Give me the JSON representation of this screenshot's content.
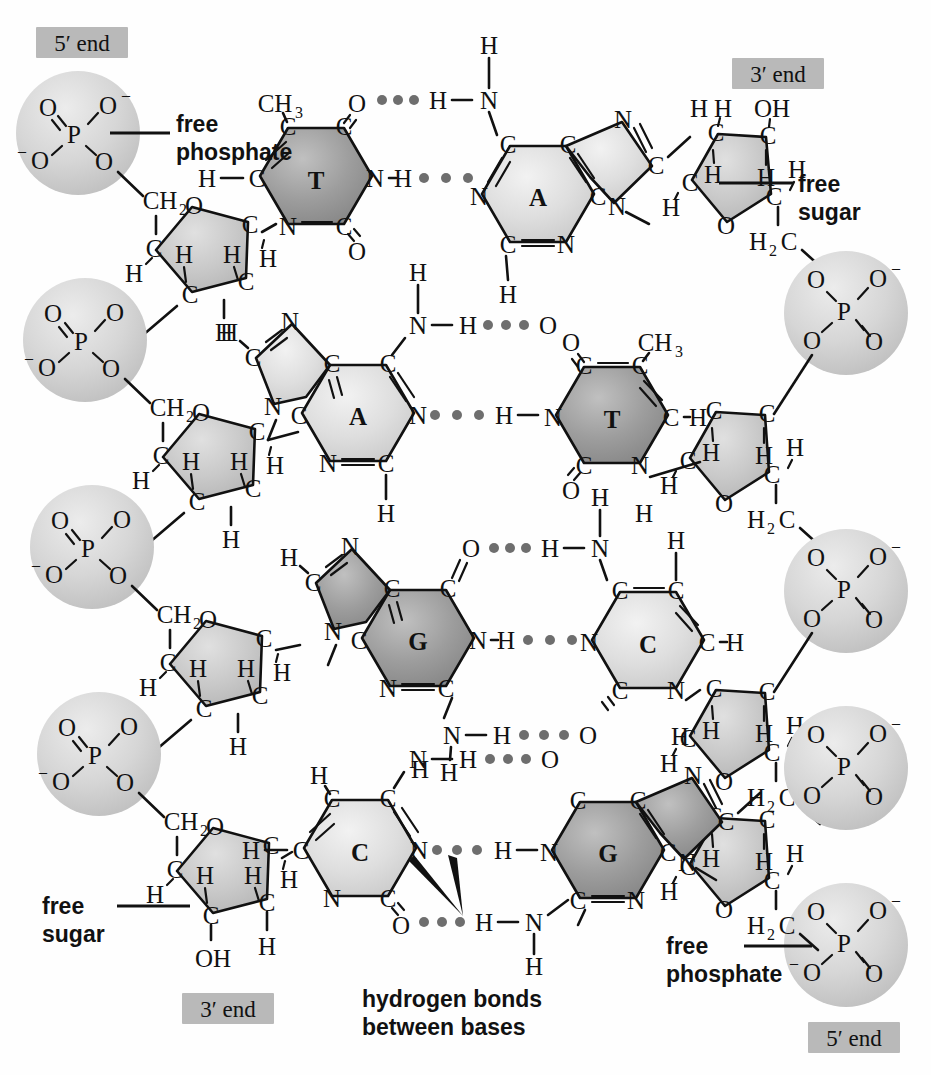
{
  "diagram": {
    "background": "#ffffff",
    "colors": {
      "dark_base": "#9a9a9a",
      "light_base": "#dcdcdc",
      "sugar": "#c8c8c8",
      "phosphate": "#d2d2d2",
      "end_label_box": "#b9b9b9",
      "hbond_dot": "#6e6e6e",
      "bond_line": "#111111"
    }
  },
  "end_labels": {
    "top_left": "5′ end",
    "top_right": "3′ end",
    "bottom_left": "3′ end",
    "bottom_right": "5′ end"
  },
  "callouts": {
    "free_phosphate_top": {
      "line1": "free",
      "line2": "phosphate"
    },
    "free_sugar_top": {
      "line1": "free",
      "line2": "sugar"
    },
    "free_sugar_bottom": {
      "line1": "free",
      "line2": "sugar"
    },
    "free_phosphate_bottom": {
      "line1": "free",
      "line2": "phosphate"
    },
    "hydrogen_bonds": {
      "line1": "hydrogen bonds",
      "line2": "between bases"
    }
  },
  "base_pairs": [
    {
      "left": "T",
      "right": "A",
      "left_type": "pyrimidine",
      "right_type": "purine",
      "hbond_count": 2
    },
    {
      "left": "A",
      "right": "T",
      "left_type": "purine",
      "right_type": "pyrimidine",
      "hbond_count": 2
    },
    {
      "left": "G",
      "right": "C",
      "left_type": "purine",
      "right_type": "pyrimidine",
      "hbond_count": 3
    },
    {
      "left": "C",
      "right": "G",
      "left_type": "pyrimidine",
      "right_type": "purine",
      "hbond_count": 3
    }
  ],
  "atoms": {
    "carbon": "C",
    "nitrogen": "N",
    "oxygen": "O",
    "hydrogen": "H",
    "phosphorus": "P",
    "methyl": "CH",
    "methyl_sub": "3",
    "methylene": "CH",
    "methylene_sub": "2",
    "methylene_alt": "H",
    "methylene_alt_sub": "2",
    "methylene_alt_c": "C",
    "hydroxyl": "OH",
    "minus": "–"
  },
  "strands": {
    "left_label": "left strand runs 5′ (top) to 3′ (bottom)",
    "right_label": "right strand runs 3′ (top) to 5′ (bottom)"
  }
}
